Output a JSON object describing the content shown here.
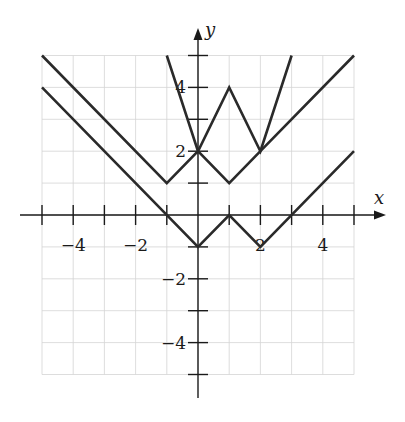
{
  "chart_data": {
    "type": "line",
    "title": "",
    "xlabel": "x",
    "ylabel": "y",
    "xlim": [
      -5,
      5
    ],
    "ylim": [
      -5,
      5
    ],
    "grid": true,
    "x_tick_labels": [
      "-4",
      "-2",
      "2",
      "4"
    ],
    "y_tick_labels": [
      "4",
      "2",
      "-2",
      "-4"
    ],
    "x_ticks": [
      -5,
      -4,
      -3,
      -2,
      -1,
      1,
      2,
      3,
      4,
      5
    ],
    "y_ticks": [
      5,
      4,
      3,
      2,
      1,
      -1,
      -2,
      -3,
      -4,
      -5
    ],
    "series": [
      {
        "name": "upper-w-graph",
        "x": [
          -5,
          -1,
          0,
          1,
          2,
          5
        ],
        "y": [
          5,
          1,
          2,
          1,
          2,
          5
        ]
      },
      {
        "name": "lower-w-graph",
        "x": [
          -5,
          0,
          1,
          2,
          5
        ],
        "y": [
          4,
          -1,
          0,
          -1,
          2
        ]
      },
      {
        "name": "steep-w-graph",
        "x": [
          -1,
          0,
          1,
          2,
          3
        ],
        "y": [
          5,
          2,
          4,
          2,
          5
        ]
      }
    ],
    "legend": null
  },
  "labels": {
    "x_axis": "x",
    "y_axis": "y",
    "x_ticks": [
      {
        "value": -4,
        "text": "−4"
      },
      {
        "value": -2,
        "text": "−2"
      },
      {
        "value": 2,
        "text": "2"
      },
      {
        "value": 4,
        "text": "4"
      }
    ],
    "y_ticks": [
      {
        "value": 4,
        "text": "4"
      },
      {
        "value": 2,
        "text": "2"
      },
      {
        "value": -2,
        "text": "−2"
      },
      {
        "value": -4,
        "text": "−4"
      }
    ]
  },
  "layout": {
    "origin_px": [
      198,
      215
    ],
    "unit_x_px": 31.2,
    "unit_y_px": 31.9,
    "curve_color": "#2a2a2a",
    "grid_color": "#d4d4d4",
    "axis_color": "#1a1a1a"
  }
}
